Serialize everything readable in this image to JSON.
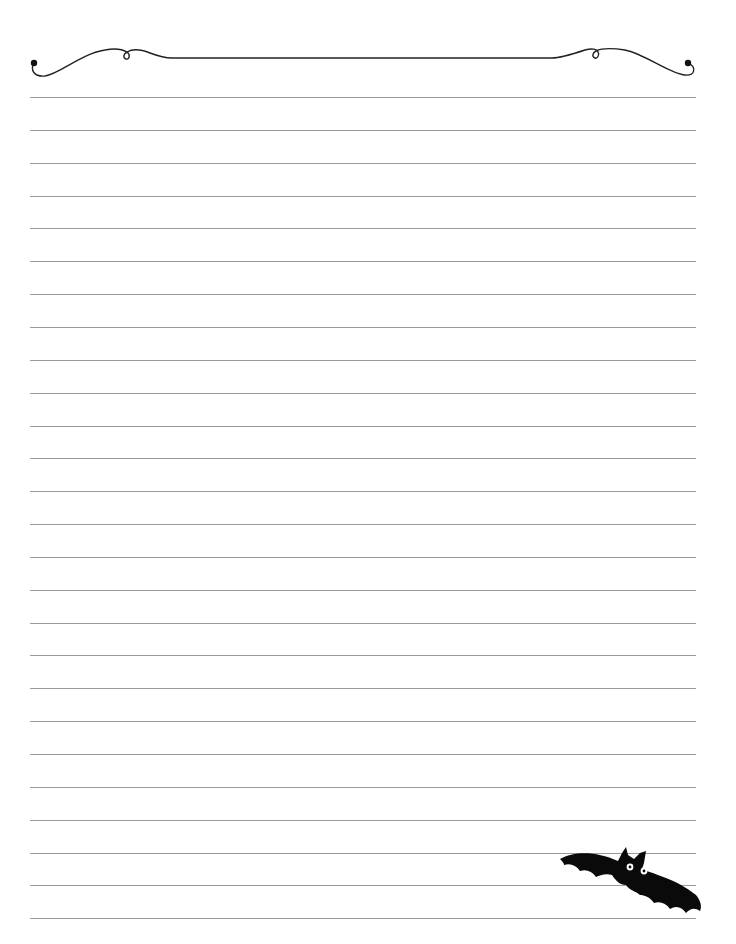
{
  "page": {
    "type": "lined-stationery",
    "background_color": "#ffffff",
    "line_color": "#9a9a9a",
    "ink_color": "#111111"
  },
  "lines": {
    "count": 26,
    "first_y": 97,
    "spacing": 32.85,
    "left_x": 30,
    "right_x": 696
  },
  "decorations": {
    "header": "scroll-flourish-border",
    "footer": "bat-illustration"
  }
}
